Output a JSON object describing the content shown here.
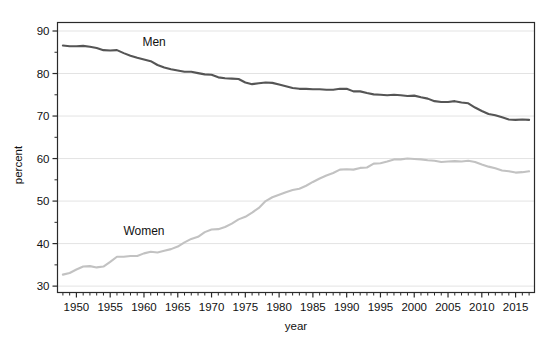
{
  "chart_data": {
    "type": "line",
    "title": "",
    "xlabel": "year",
    "ylabel": "percent",
    "xlim": [
      1947.2,
      2017.8
    ],
    "ylim": [
      28.5,
      92.0
    ],
    "grid": true,
    "grid_axis": "y",
    "legend_position": "inline-annotation",
    "x_major_ticks": [
      1950,
      1955,
      1960,
      1965,
      1970,
      1975,
      1980,
      1985,
      1990,
      1995,
      2000,
      2005,
      2010,
      2015
    ],
    "x_major_tick_labels": [
      "1950",
      "1955",
      "1960",
      "1965",
      "1970",
      "1975",
      "1980",
      "1985",
      "1990",
      "1995",
      "2000",
      "2005",
      "2010",
      "2015"
    ],
    "x_minor_tick_step": 1,
    "y_major_ticks": [
      30,
      40,
      50,
      60,
      70,
      80,
      90
    ],
    "y_major_tick_labels": [
      "30",
      "40",
      "50",
      "60",
      "70",
      "80",
      "90"
    ],
    "y_minor_ticks": [
      35,
      45,
      55,
      65,
      75,
      85
    ],
    "x": [
      1948,
      1949,
      1950,
      1951,
      1952,
      1953,
      1954,
      1955,
      1956,
      1957,
      1958,
      1959,
      1960,
      1961,
      1962,
      1963,
      1964,
      1965,
      1966,
      1967,
      1968,
      1969,
      1970,
      1971,
      1972,
      1973,
      1974,
      1975,
      1976,
      1977,
      1978,
      1979,
      1980,
      1981,
      1982,
      1983,
      1984,
      1985,
      1986,
      1987,
      1988,
      1989,
      1990,
      1991,
      1992,
      1993,
      1994,
      1995,
      1996,
      1997,
      1998,
      1999,
      2000,
      2001,
      2002,
      2003,
      2004,
      2005,
      2006,
      2007,
      2008,
      2009,
      2010,
      2011,
      2012,
      2013,
      2014,
      2015,
      2016,
      2017
    ],
    "series": [
      {
        "name": "Men",
        "color": "#555555",
        "label_x": 1961.5,
        "label_y": 86.5,
        "values": [
          86.6,
          86.4,
          86.4,
          86.5,
          86.3,
          86.0,
          85.5,
          85.4,
          85.5,
          84.8,
          84.2,
          83.7,
          83.3,
          82.9,
          82.0,
          81.4,
          81.0,
          80.7,
          80.4,
          80.4,
          80.1,
          79.8,
          79.7,
          79.1,
          78.9,
          78.8,
          78.7,
          77.9,
          77.5,
          77.7,
          77.9,
          77.8,
          77.4,
          77.0,
          76.6,
          76.4,
          76.4,
          76.3,
          76.3,
          76.2,
          76.2,
          76.4,
          76.4,
          75.8,
          75.8,
          75.4,
          75.1,
          75.0,
          74.9,
          75.0,
          74.9,
          74.7,
          74.8,
          74.4,
          74.1,
          73.5,
          73.3,
          73.3,
          73.5,
          73.2,
          73.0,
          72.0,
          71.2,
          70.5,
          70.2,
          69.7,
          69.2,
          69.1,
          69.2,
          69.1
        ]
      },
      {
        "name": "Women",
        "color": "#c2c2c2",
        "label_x": 1960.0,
        "label_y": 42.0,
        "values": [
          32.7,
          33.1,
          33.9,
          34.6,
          34.7,
          34.4,
          34.6,
          35.7,
          36.9,
          36.9,
          37.1,
          37.1,
          37.7,
          38.1,
          37.9,
          38.3,
          38.7,
          39.3,
          40.3,
          41.1,
          41.6,
          42.7,
          43.3,
          43.4,
          43.9,
          44.7,
          45.7,
          46.3,
          47.3,
          48.4,
          50.0,
          50.9,
          51.5,
          52.1,
          52.6,
          52.9,
          53.6,
          54.5,
          55.3,
          56.0,
          56.6,
          57.4,
          57.5,
          57.4,
          57.8,
          57.9,
          58.8,
          58.9,
          59.3,
          59.8,
          59.8,
          60.0,
          59.9,
          59.8,
          59.6,
          59.5,
          59.2,
          59.3,
          59.4,
          59.3,
          59.5,
          59.2,
          58.6,
          58.1,
          57.7,
          57.2,
          57.0,
          56.7,
          56.8,
          57.0
        ]
      }
    ]
  },
  "axes": {
    "ylabel": "percent",
    "xlabel": "year"
  }
}
